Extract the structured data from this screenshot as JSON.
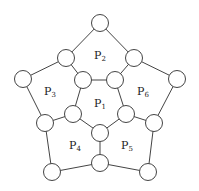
{
  "diagram": {
    "width": 199,
    "height": 191,
    "node_radius": 8.5,
    "stroke_color": "#444444",
    "fill_color": "#ffffff",
    "nodes": [
      {
        "id": "n0",
        "x": 100,
        "y": 23
      },
      {
        "id": "n1",
        "x": 66,
        "y": 58
      },
      {
        "id": "n2",
        "x": 134,
        "y": 58
      },
      {
        "id": "n3",
        "x": 83,
        "y": 80
      },
      {
        "id": "n4",
        "x": 115,
        "y": 80
      },
      {
        "id": "n5",
        "x": 23,
        "y": 79
      },
      {
        "id": "n6",
        "x": 177,
        "y": 79
      },
      {
        "id": "n7",
        "x": 73,
        "y": 114
      },
      {
        "id": "n8",
        "x": 126,
        "y": 114
      },
      {
        "id": "n9",
        "x": 45,
        "y": 123
      },
      {
        "id": "n10",
        "x": 154,
        "y": 123
      },
      {
        "id": "n11",
        "x": 100,
        "y": 133
      },
      {
        "id": "n12",
        "x": 100,
        "y": 163
      },
      {
        "id": "n13",
        "x": 52,
        "y": 172
      },
      {
        "id": "n14",
        "x": 148,
        "y": 172
      }
    ],
    "edges": [
      [
        "n0",
        "n1"
      ],
      [
        "n0",
        "n2"
      ],
      [
        "n1",
        "n3"
      ],
      [
        "n2",
        "n4"
      ],
      [
        "n3",
        "n4"
      ],
      [
        "n1",
        "n5"
      ],
      [
        "n2",
        "n6"
      ],
      [
        "n3",
        "n7"
      ],
      [
        "n4",
        "n8"
      ],
      [
        "n5",
        "n9"
      ],
      [
        "n6",
        "n10"
      ],
      [
        "n7",
        "n9"
      ],
      [
        "n8",
        "n10"
      ],
      [
        "n7",
        "n11"
      ],
      [
        "n8",
        "n11"
      ],
      [
        "n11",
        "n12"
      ],
      [
        "n9",
        "n13"
      ],
      [
        "n10",
        "n14"
      ],
      [
        "n12",
        "n13"
      ],
      [
        "n12",
        "n14"
      ]
    ],
    "labels": [
      {
        "name": "P",
        "sub": "1",
        "x": 100,
        "y": 107
      },
      {
        "name": "P",
        "sub": "2",
        "x": 100,
        "y": 59
      },
      {
        "name": "P",
        "sub": "3",
        "x": 50,
        "y": 95
      },
      {
        "name": "P",
        "sub": "4",
        "x": 75,
        "y": 149
      },
      {
        "name": "P",
        "sub": "5",
        "x": 127,
        "y": 149
      },
      {
        "name": "P",
        "sub": "6",
        "x": 143,
        "y": 95
      }
    ]
  }
}
